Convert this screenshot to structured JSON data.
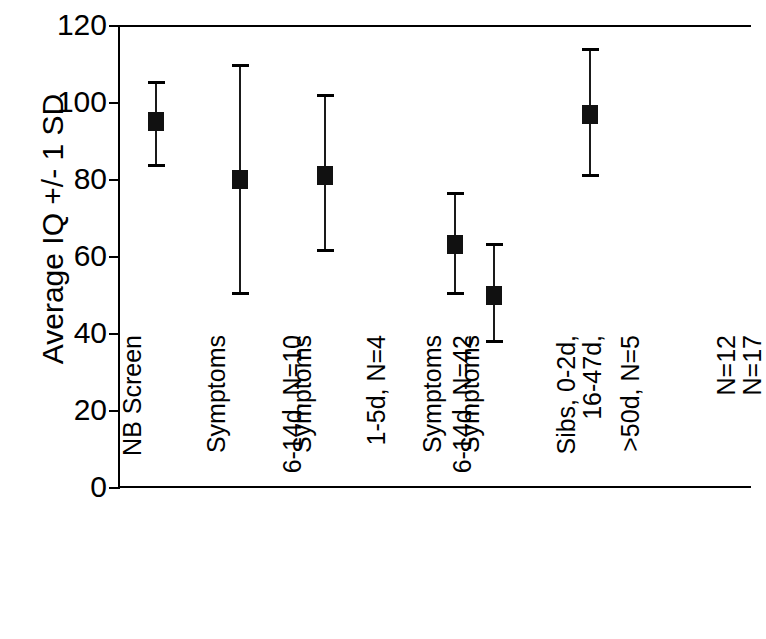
{
  "chart_data": {
    "type": "scatter",
    "title": "",
    "xlabel": "",
    "ylabel": "Average IQ +/- 1 SD",
    "ylim": [
      0,
      120
    ],
    "yticks": [
      0,
      20,
      40,
      60,
      80,
      100,
      120
    ],
    "ytick_labels": [
      "0",
      "20",
      "40",
      "60",
      "80",
      "100",
      "120"
    ],
    "grid": false,
    "legend": "none",
    "error_bars": "±1 SD",
    "categories": [
      "NB Screen 6-14d, N=10",
      "Symptoms 1-5d, N=4",
      "Symptoms 6-14d, N=42",
      "Symptoms 16-47d, N=17",
      "Symptoms >50d, N=5",
      "Sibs, 0-2d, N=12"
    ],
    "category_lines": [
      [
        "NB Screen",
        "6-14d, N=10"
      ],
      [
        "Symptoms",
        "1-5d, N=4"
      ],
      [
        "Symptoms",
        "6-14d, N=42"
      ],
      [
        "Symptoms",
        "16-47d,",
        "N=17"
      ],
      [
        "Symptoms",
        ">50d, N=5"
      ],
      [
        "Sibs, 0-2d,",
        "N=12"
      ]
    ],
    "values": [
      95,
      80,
      81,
      63,
      50,
      97
    ],
    "err_low": [
      83,
      50,
      61,
      50,
      37.5,
      80.5
    ],
    "err_high": [
      105.5,
      110,
      102,
      76.5,
      63.5,
      114
    ],
    "series": [
      {
        "name": "Average IQ",
        "points": [
          {
            "category": "NB Screen 6-14d, N=10",
            "mean": 95,
            "low": 83,
            "high": 105.5
          },
          {
            "category": "Symptoms 1-5d, N=4",
            "mean": 80,
            "low": 50,
            "high": 110
          },
          {
            "category": "Symptoms 6-14d, N=42",
            "mean": 81,
            "low": 61,
            "high": 102
          },
          {
            "category": "Symptoms 16-47d, N=17",
            "mean": 63,
            "low": 50,
            "high": 76.5
          },
          {
            "category": "Symptoms >50d, N=5",
            "mean": 50,
            "low": 37.5,
            "high": 63.5
          },
          {
            "category": "Sibs, 0-2d, N=12",
            "mean": 97,
            "low": 80.5,
            "high": 114
          }
        ]
      }
    ],
    "marker_color": "#111111",
    "axis_color": "#000000",
    "background_color": "#ffffff"
  }
}
